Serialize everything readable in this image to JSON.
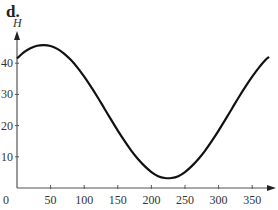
{
  "panel_label": "d.",
  "chart_data": {
    "type": "line",
    "title": "",
    "xlabel": "t",
    "ylabel": "H",
    "xlim": [
      0,
      380
    ],
    "ylim": [
      0,
      48
    ],
    "x_ticks": [
      0,
      50,
      100,
      150,
      200,
      250,
      300,
      350
    ],
    "y_ticks": [
      10,
      20,
      30,
      40
    ],
    "grid": false,
    "legend": null,
    "series": [
      {
        "name": "H",
        "x": [
          0,
          10,
          20,
          30,
          40,
          50,
          60,
          70,
          80,
          90,
          100,
          110,
          120,
          130,
          140,
          150,
          160,
          170,
          180,
          190,
          200,
          210,
          220,
          230,
          240,
          250,
          260,
          270,
          280,
          290,
          300,
          310,
          320,
          330,
          340,
          350,
          360,
          370,
          375
        ],
        "y": [
          41.5,
          43.5,
          44.8,
          45.6,
          45.8,
          45.5,
          44.6,
          43.1,
          41.1,
          38.6,
          35.7,
          32.5,
          29.1,
          25.5,
          21.9,
          18.4,
          15.1,
          12.0,
          9.3,
          7.0,
          5.1,
          3.8,
          3.2,
          3.2,
          3.8,
          5.1,
          7.0,
          9.3,
          12.0,
          15.1,
          18.4,
          21.9,
          25.5,
          29.1,
          32.5,
          35.7,
          38.6,
          41.1,
          42.0
        ]
      }
    ]
  }
}
